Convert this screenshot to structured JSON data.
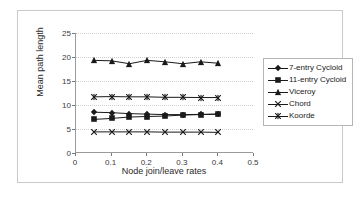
{
  "chart_data": {
    "type": "line",
    "title": "",
    "xlabel": "Node join/leave rates",
    "ylabel": "Mean path length",
    "xlim": [
      0,
      0.5
    ],
    "ylim": [
      0,
      25
    ],
    "xticks": [
      "0",
      "0.1",
      "0.2",
      "0.3",
      "0.4",
      "0.5"
    ],
    "xtick_values": [
      0,
      0.1,
      0.2,
      0.3,
      0.4,
      0.5
    ],
    "yticks": [
      "0",
      "5",
      "10",
      "15",
      "20",
      "25"
    ],
    "ytick_values": [
      0,
      5,
      10,
      15,
      20,
      25
    ],
    "grid": true,
    "legend_position": "right",
    "x": [
      0.05,
      0.1,
      0.15,
      0.2,
      0.25,
      0.3,
      0.35,
      0.4
    ],
    "series": [
      {
        "name": "7-entry Cycloid",
        "marker": "diamond",
        "values": [
          8.5,
          8.4,
          8.2,
          8.1,
          8.0,
          8.0,
          8.05,
          8.1
        ]
      },
      {
        "name": "11-entry Cycloid",
        "marker": "square",
        "values": [
          7.0,
          7.2,
          7.5,
          7.6,
          7.7,
          7.9,
          8.0,
          8.1
        ]
      },
      {
        "name": "Viceroy",
        "marker": "triangle",
        "values": [
          19.3,
          19.2,
          18.6,
          19.3,
          19.0,
          18.6,
          19.0,
          18.7
        ]
      },
      {
        "name": "Chord",
        "marker": "x",
        "values": [
          4.4,
          4.4,
          4.4,
          4.4,
          4.35,
          4.35,
          4.35,
          4.3
        ]
      },
      {
        "name": "Koorde",
        "marker": "asterisk",
        "values": [
          11.7,
          11.75,
          11.7,
          11.7,
          11.6,
          11.6,
          11.55,
          11.55
        ]
      }
    ]
  },
  "legend": {
    "items": [
      {
        "label": "7-entry Cycloid"
      },
      {
        "label": "11-entry Cycloid"
      },
      {
        "label": "Viceroy"
      },
      {
        "label": "Chord"
      },
      {
        "label": "Koorde"
      }
    ]
  }
}
